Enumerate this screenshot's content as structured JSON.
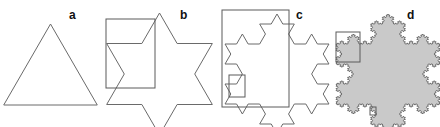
{
  "figure": {
    "panels": [
      {
        "label": "a",
        "iteration": 0,
        "filled": false,
        "zoom_boxes": 0
      },
      {
        "label": "b",
        "iteration": 1,
        "filled": false,
        "zoom_boxes": 1
      },
      {
        "label": "c",
        "iteration": 2,
        "filled": false,
        "zoom_boxes": 2
      },
      {
        "label": "d",
        "iteration": 4,
        "filled": true,
        "zoom_boxes": 2
      }
    ],
    "colors": {
      "stroke": "#6a6a6a",
      "fill": "#c9c9c9",
      "frame": "#5a5a5a",
      "label": "#111111"
    }
  }
}
